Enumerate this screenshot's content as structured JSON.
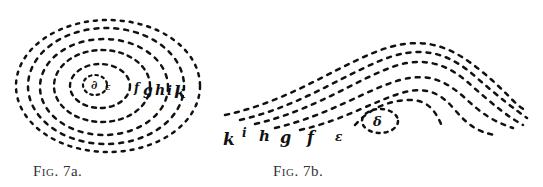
{
  "figures": [
    {
      "id": "7a",
      "caption": "Fig. 7a.",
      "caption_prefix": "Fig.",
      "caption_number": "7a.",
      "description": "concentric dotted elliptical lines",
      "labels": [
        "∂",
        "ε",
        "f",
        "g",
        "h",
        "i",
        "k"
      ]
    },
    {
      "id": "7b",
      "caption": "Fig. 7b.",
      "caption_prefix": "Fig.",
      "caption_number": "7b.",
      "description": "dotted arched lines with small closed loop",
      "labels": [
        "k",
        "i",
        "h",
        "g",
        "f",
        "ε",
        "δ"
      ]
    }
  ],
  "colors": {
    "ink": "#111111",
    "background": "#ffffff"
  }
}
